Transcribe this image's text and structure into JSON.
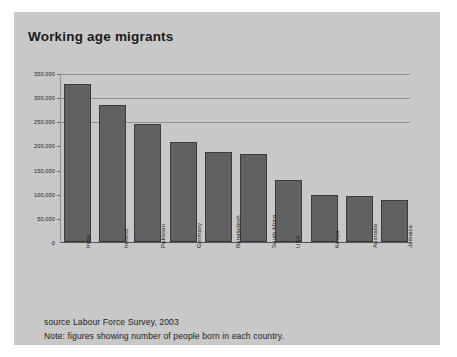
{
  "title": "Working age migrants",
  "footer": {
    "source": "source Labour Force Survey, 2003",
    "note": "Note: figures showing number of people born in each country."
  },
  "colors": {
    "panel": "#c8c8c8",
    "bar_fill": "#616161",
    "bar_stroke": "#3b3b3b",
    "gridline": "#8f8f8f",
    "text": "#1c1c1c"
  },
  "chart_data": {
    "type": "bar",
    "title": "Working age migrants",
    "xlabel": "",
    "ylabel": "",
    "ylim": [
      0,
      350000
    ],
    "grid": true,
    "legend": "none",
    "ytick_labels": [
      "350,000",
      "300,000",
      "250,000",
      "200,000",
      "150,000",
      "100,000",
      "50,000",
      "0"
    ],
    "ytick_values": [
      350000,
      300000,
      250000,
      200000,
      150000,
      100000,
      50000,
      0
    ],
    "categories": [
      "India",
      "Ireland",
      "Pakistan",
      "Germany",
      "Bangladesh",
      "South Africa",
      "USA",
      "Kenya",
      "Australia",
      "Jamaica"
    ],
    "values": [
      330000,
      285000,
      245000,
      208000,
      188000,
      183000,
      130000,
      97000,
      95000,
      87000
    ]
  }
}
